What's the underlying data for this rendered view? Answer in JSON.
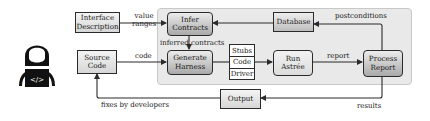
{
  "diagram": {
    "actor": {
      "icon": "developer-with-laptop-icon",
      "laptop_glyph": "</>"
    },
    "nodes": {
      "interface_description": {
        "line1": "Interface",
        "line2": "Description"
      },
      "source_code": {
        "line1": "Source",
        "line2": "Code"
      },
      "infer_contracts": {
        "line1": "Infer",
        "line2": "Contracts"
      },
      "generate_harness": {
        "line1": "Generate",
        "line2": "Harness"
      },
      "harness_parts": [
        "Stubs",
        "Code",
        "Driver"
      ],
      "run_astree": {
        "line1": "Run",
        "line2": "Astrée"
      },
      "database": {
        "label": "Database"
      },
      "process_report": {
        "line1": "Process",
        "line2": "Report"
      },
      "output": {
        "label": "Output"
      }
    },
    "edges": {
      "value_ranges": {
        "line1": "value",
        "line2": "ranges"
      },
      "code": "code",
      "inferred_contracts": "inferred contracts",
      "report": "report",
      "postconditions": "postconditions",
      "results": "results",
      "fixes_by_developers": "fixes by developers"
    },
    "colors": {
      "panel_bg": "#e9e9e9",
      "stroke": "#2b2b2b",
      "rounded_gradient_top": "#ececec",
      "rounded_gradient_bottom": "#a9a9a9",
      "plain_gradient_top": "#f4f4f4",
      "plain_gradient_bottom": "#d6d6d6"
    }
  }
}
